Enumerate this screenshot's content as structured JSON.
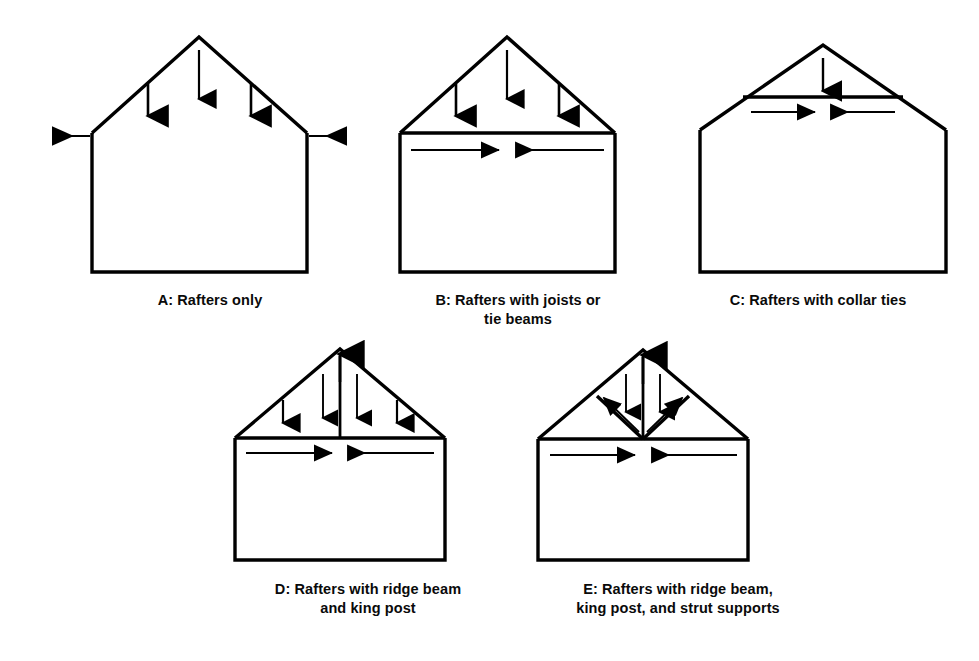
{
  "page": {
    "background_color": "#ffffff",
    "ink_color": "#000000"
  },
  "figures": [
    {
      "id": "A",
      "caption": "A: Rafters only",
      "members": [
        "left rafter",
        "right rafter",
        "left wall",
        "right wall",
        "floor"
      ],
      "load_arrows_down": 3,
      "thrust_arrows_outward": 2,
      "tie_beam": false,
      "collar_tie": false,
      "king_post": false,
      "struts": 0
    },
    {
      "id": "B",
      "caption": "B: Rafters with joists or\ntie beams",
      "members": [
        "left rafter",
        "right rafter",
        "tie beam at eaves",
        "left wall",
        "right wall",
        "floor"
      ],
      "load_arrows_down": 3,
      "thrust_arrows_outward": 0,
      "tie_beam": true,
      "tie_arrows_opposing": 2,
      "collar_tie": false,
      "king_post": false,
      "struts": 0
    },
    {
      "id": "C",
      "caption": "C: Rafters with collar ties",
      "members": [
        "left rafter",
        "right rafter",
        "collar tie",
        "left wall",
        "right wall",
        "floor"
      ],
      "load_arrows_down": 1,
      "thrust_arrows_outward": 0,
      "tie_beam": false,
      "collar_tie": true,
      "tie_arrows_opposing": 2,
      "king_post": false,
      "struts": 0
    },
    {
      "id": "D",
      "caption": "D: Rafters with ridge beam\nand king post",
      "members": [
        "left rafter",
        "right rafter",
        "tie beam",
        "king post",
        "left wall",
        "right wall",
        "floor"
      ],
      "load_arrows_down": 4,
      "ridge_arrow_up": 1,
      "tie_beam": true,
      "tie_arrows_opposing": 2,
      "king_post": true,
      "struts": 0
    },
    {
      "id": "E",
      "caption": "E: Rafters with ridge beam,\nking post, and strut supports",
      "members": [
        "left rafter",
        "right rafter",
        "tie beam",
        "king post",
        "left strut",
        "right strut",
        "left wall",
        "right wall",
        "floor"
      ],
      "load_arrows_down": 2,
      "ridge_arrow_up": 1,
      "tie_beam": true,
      "tie_arrows_opposing": 2,
      "king_post": true,
      "struts": 2,
      "strut_arrows_up": 2
    }
  ]
}
